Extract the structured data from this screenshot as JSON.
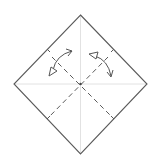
{
  "diagram": {
    "type": "origami-fold-diagram",
    "colors": {
      "background": "#ffffff",
      "outline": "#555555",
      "crease": "#e2e2e2",
      "dashed": "#555555",
      "arrow": "#555555"
    },
    "paper": {
      "vertices": {
        "top": [
          80.5,
          15
        ],
        "right": [
          147,
          84
        ],
        "bottom": [
          80.5,
          154
        ],
        "left": [
          14,
          84
        ]
      }
    },
    "creases": [
      {
        "name": "vertical-center-crease",
        "from": [
          80.5,
          15
        ],
        "to": [
          80.5,
          154
        ]
      },
      {
        "name": "horizontal-center-crease",
        "from": [
          14,
          84
        ],
        "to": [
          147,
          84
        ]
      }
    ],
    "edge_ticks": [
      {
        "name": "tick-top-left",
        "from": [
          47,
          49
        ],
        "to": [
          50,
          52
        ]
      },
      {
        "name": "tick-top-right",
        "from": [
          114,
          49
        ],
        "to": [
          111,
          52
        ]
      },
      {
        "name": "tick-bottom-left",
        "from": [
          47,
          119
        ],
        "to": [
          50,
          116
        ]
      },
      {
        "name": "tick-bottom-right",
        "from": [
          114,
          119
        ],
        "to": [
          111,
          116
        ]
      }
    ],
    "valley_folds": [
      {
        "name": "valley-fold-tl-br",
        "from": [
          52,
          57
        ],
        "to": [
          114,
          119
        ]
      },
      {
        "name": "valley-fold-tr-bl",
        "from": [
          108,
          57
        ],
        "to": [
          47,
          119
        ]
      }
    ],
    "center_point": [
      80.5,
      84
    ],
    "arrows": [
      {
        "name": "fold-unfold-arrow-left",
        "path": "M52,73 Q55,55 72,51",
        "open_head": [
          72,
          51
        ],
        "hollow_head": [
          52,
          73
        ]
      },
      {
        "name": "fold-unfold-arrow-right",
        "path": "M91,54 Q108,58 111,76",
        "open_head": [
          111,
          76
        ],
        "hollow_head": [
          91,
          54
        ]
      }
    ]
  }
}
